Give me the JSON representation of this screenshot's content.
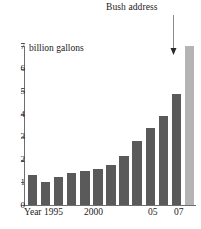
{
  "chart_data": {
    "type": "bar",
    "title": "",
    "subtitle": "",
    "xlabel": "",
    "ylabel": "billion gallons",
    "unit_label": "billion gallons",
    "categories": [
      "1995",
      "1996",
      "1997",
      "1998",
      "1999",
      "2000",
      "2001",
      "2002",
      "2003",
      "2004",
      "2005",
      "2006",
      "2007"
    ],
    "values": [
      1.3,
      1.0,
      1.25,
      1.4,
      1.5,
      1.6,
      1.75,
      2.15,
      2.8,
      3.4,
      3.9,
      4.9,
      7.0
    ],
    "ylim": [
      0,
      7
    ],
    "y_ticks": [
      0,
      1,
      2,
      3,
      4,
      5,
      6,
      7
    ],
    "y_tick_labels": [
      "0",
      "1",
      "2",
      "3",
      "4",
      "5",
      "6",
      "7"
    ],
    "x_tick_labels": [
      {
        "text": "Year 1995",
        "category": "1995"
      },
      {
        "text": "2000",
        "category": "2000"
      },
      {
        "text": "05",
        "category": "2005"
      },
      {
        "text": "07",
        "category": "2007"
      }
    ],
    "grid": false,
    "legend": "none",
    "annotations": [
      {
        "text": "Bush address",
        "target_category": "2007",
        "target_value": 7.0,
        "arrow": "down"
      }
    ],
    "series_colors": {
      "bar_default": "#5a5a5a",
      "bar_highlight": "#b4b4b4",
      "bar_highlight_category": "2007",
      "axis": "#6e6e6e",
      "text": "#1a1a1a",
      "background": "#ffffff"
    }
  },
  "annotation": {
    "label": "Bush address"
  },
  "axis": {
    "unit_label": "billion gallons"
  },
  "x_labels": [
    {
      "text": "Year 1995",
      "left": 24
    },
    {
      "text": "2000",
      "left": 84
    },
    {
      "text": "05",
      "left": 148
    },
    {
      "text": "07",
      "left": 174
    }
  ],
  "caption": {
    "clipped_text": ""
  }
}
